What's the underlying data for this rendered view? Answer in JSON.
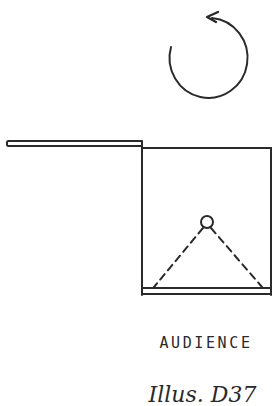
{
  "diagram": {
    "elements": {
      "rotation_arrow": {
        "icon": "counterclockwise-rotation-arrow",
        "direction": "counterclockwise"
      },
      "flat": {
        "description": "horizontal flat/wall extending left from stage"
      },
      "stage": {
        "description": "square stage area"
      },
      "performer": {
        "icon": "circle-figure",
        "sightlines": "dashed"
      },
      "apron": {
        "description": "stage front edge"
      }
    },
    "label": "AUDIENCE",
    "caption": "Illus. D37"
  },
  "colors": {
    "ink": "#2a2a2a",
    "background": "#ffffff"
  }
}
